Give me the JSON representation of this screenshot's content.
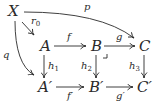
{
  "diagram": {
    "type": "commutative-diagram",
    "nodes": {
      "X": "X",
      "A": "A",
      "B": "B",
      "C": "C",
      "A_prime": "A′",
      "B_prime": "B′",
      "C_prime": "C′"
    },
    "arrows": {
      "p": "p",
      "q": "q",
      "r0": "r0",
      "f": "f",
      "g": "g",
      "h1": "h1",
      "h2": "h2",
      "h3": "h3",
      "f_prime": "f′",
      "g_prime": "g′"
    },
    "edges": [
      {
        "from": "X",
        "to": "C",
        "label": "p",
        "style": "curved"
      },
      {
        "from": "X",
        "to": "A",
        "label": "r0"
      },
      {
        "from": "X",
        "to": "A′",
        "label": "q",
        "style": "curved"
      },
      {
        "from": "A",
        "to": "B",
        "label": "f"
      },
      {
        "from": "B",
        "to": "C",
        "label": "g"
      },
      {
        "from": "A",
        "to": "A′",
        "label": "h1"
      },
      {
        "from": "B",
        "to": "B′",
        "label": "h2"
      },
      {
        "from": "C",
        "to": "C′",
        "label": "h3"
      },
      {
        "from": "A′",
        "to": "B′",
        "label": "f′"
      },
      {
        "from": "B′",
        "to": "C′",
        "label": "g′"
      }
    ],
    "pullback_mark": "B"
  }
}
